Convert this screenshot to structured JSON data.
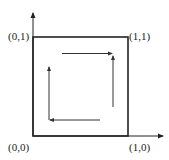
{
  "diagram": {
    "type": "unit-square-circulation",
    "colors": {
      "stroke": "#222222",
      "arrow": "#333333",
      "background": "#ffffff"
    },
    "axes": {
      "x_axis": {
        "direction": "right",
        "arrow": true
      },
      "y_axis": {
        "direction": "up",
        "arrow": true
      }
    },
    "square": {
      "corners": [
        "(0,0)",
        "(1,0)",
        "(1,1)",
        "(0,1)"
      ]
    },
    "labels": {
      "origin": "(0,0)",
      "bottom_right": "(1,0)",
      "top_right": "(1,1)",
      "top_left": "(0,1)"
    },
    "inner_arrows": [
      {
        "name": "top",
        "direction": "right"
      },
      {
        "name": "right",
        "direction": "up"
      },
      {
        "name": "bottom",
        "direction": "left"
      },
      {
        "name": "left",
        "direction": "up"
      }
    ]
  }
}
